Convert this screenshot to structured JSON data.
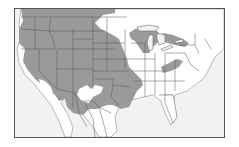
{
  "map": {
    "type": "range-map",
    "region": "North America (contiguous United States and northern Mexico)",
    "colors": {
      "ocean": "#f2f2f2",
      "land": "#ffffff",
      "range": "#9a9a9a",
      "borders": "#555555",
      "frame": "#555555"
    },
    "legend": [],
    "labels": []
  }
}
